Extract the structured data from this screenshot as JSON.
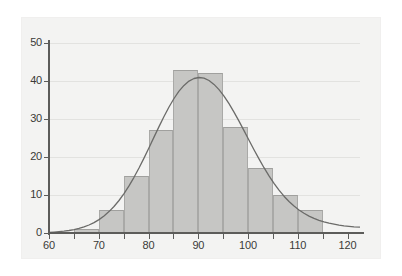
{
  "chart_data": {
    "type": "bar",
    "title": "",
    "subtitle": "",
    "xlabel": "",
    "ylabel": "",
    "grid": true,
    "legend": null,
    "xlim": [
      60,
      122.5
    ],
    "ylim": [
      0,
      50
    ],
    "bin_width": 5,
    "x_ticks": [
      "60",
      "70",
      "80",
      "90",
      "100",
      "110",
      "120"
    ],
    "x_tick_values": [
      60,
      70,
      80,
      90,
      100,
      110,
      120
    ],
    "x_minor_tick_values": [
      65,
      75,
      85,
      95,
      105,
      115
    ],
    "y_ticks": [
      "0",
      "10",
      "20",
      "30",
      "40",
      "50"
    ],
    "y_tick_values": [
      0,
      10,
      20,
      30,
      40,
      50
    ],
    "bins": [
      {
        "label": "60-65",
        "start": 60,
        "end": 65,
        "value": 0
      },
      {
        "label": "65-70",
        "start": 65,
        "end": 70,
        "value": 1
      },
      {
        "label": "70-75",
        "start": 70,
        "end": 75,
        "value": 6
      },
      {
        "label": "75-80",
        "start": 75,
        "end": 80,
        "value": 15
      },
      {
        "label": "80-85",
        "start": 80,
        "end": 85,
        "value": 27
      },
      {
        "label": "85-90",
        "start": 85,
        "end": 90,
        "value": 43
      },
      {
        "label": "90-95",
        "start": 90,
        "end": 95,
        "value": 42
      },
      {
        "label": "95-100",
        "start": 95,
        "end": 100,
        "value": 28
      },
      {
        "label": "100-105",
        "start": 100,
        "end": 105,
        "value": 17
      },
      {
        "label": "105-110",
        "start": 105,
        "end": 110,
        "value": 10
      },
      {
        "label": "110-115",
        "start": 110,
        "end": 115,
        "value": 6
      },
      {
        "label": "115-120",
        "start": 115,
        "end": 120,
        "value": 0
      }
    ],
    "categories": [
      "60-65",
      "65-70",
      "70-75",
      "75-80",
      "80-85",
      "85-90",
      "90-95",
      "95-100",
      "100-105",
      "105-110",
      "110-115",
      "115-120"
    ],
    "values": [
      0,
      1,
      6,
      15,
      27,
      43,
      42,
      28,
      17,
      10,
      6,
      0
    ],
    "overlay_curve": {
      "type": "normal-density",
      "mean": 91,
      "stddev": 9.2,
      "peak_value": 41.8,
      "color": "#6b6b69"
    },
    "colors": {
      "bar_fill": "#c6c6c4",
      "bar_edge": "#a9a9a7",
      "axis": "#5c5c5a",
      "gridline": "#e2e2e0",
      "panel_background": "#f3f3f2",
      "page_background": "#ffffff",
      "tick_label": "#3a3a38"
    }
  }
}
